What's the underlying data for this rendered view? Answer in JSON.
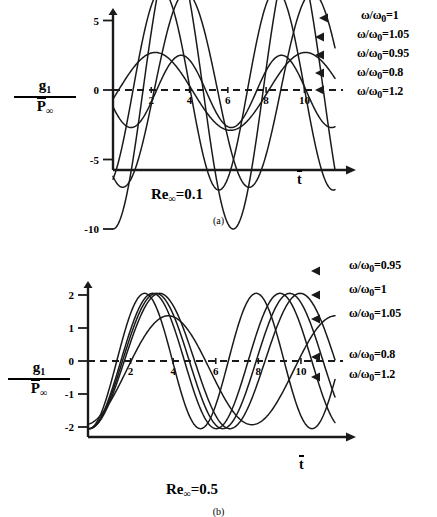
{
  "figure": {
    "ylabel_numerator": "g",
    "ylabel_numerator_sub": "1",
    "ylabel_denominator": "P",
    "ylabel_denominator_sub": "∞",
    "xlabel": "t"
  },
  "panel_a": {
    "subcaption": "(a)",
    "condition_label": "Re",
    "condition_sub": "∞",
    "condition_value": "=0.1",
    "legend": [
      {
        "label": "ω/ω",
        "sub": "0",
        "value": "=1"
      },
      {
        "label": "ω/ω",
        "sub": "0",
        "value": "=1.05"
      },
      {
        "label": "ω/ω",
        "sub": "0",
        "value": "=0.95"
      },
      {
        "label": "ω/ω",
        "sub": "0",
        "value": "=0.8"
      },
      {
        "label": "ω/ω",
        "sub": "0",
        "value": "=1.2"
      }
    ]
  },
  "panel_b": {
    "subcaption": "(b)",
    "condition_label": "Re",
    "condition_sub": "∞",
    "condition_value": "=0.5",
    "legend": [
      {
        "label": "ω/ω",
        "sub": "0",
        "value": "=0.95"
      },
      {
        "label": "ω/ω",
        "sub": "0",
        "value": "=1"
      },
      {
        "label": "ω/ω",
        "sub": "0",
        "value": "=1.05"
      },
      {
        "label": "ω/ω",
        "sub": "0",
        "value": "=0.8"
      },
      {
        "label": "ω/ω",
        "sub": "0",
        "value": "=1.2"
      }
    ]
  },
  "chart_data": [
    {
      "id": "panel_a",
      "type": "line",
      "title": "Re_inf = 0.1",
      "xlabel": "t̄",
      "ylabel": "g1/P̄_inf",
      "xlim": [
        0,
        11.6
      ],
      "ylim": [
        -10.8,
        10.8
      ],
      "xticks": [
        2,
        4,
        6,
        8,
        10
      ],
      "yticks": [
        10,
        5,
        0,
        -5,
        -10
      ],
      "grid": false,
      "zero_line": "dashed",
      "legend_position": "right",
      "series": [
        {
          "name": "ω/ω0=1",
          "amplitude": 10.0,
          "period": 6.28,
          "phase": -1.5708,
          "offset": 0.0,
          "damping": 0.0
        },
        {
          "name": "ω/ω0=1.05",
          "amplitude": 7.2,
          "period": 5.98,
          "phase": -1.1,
          "offset": 0.0,
          "damping": 0.0
        },
        {
          "name": "ω/ω0=0.95",
          "amplitude": 7.0,
          "period": 6.61,
          "phase": -2.05,
          "offset": 0.0,
          "damping": 0.0
        },
        {
          "name": "ω/ω0=0.8",
          "amplitude": 2.8,
          "period": 7.85,
          "phase": -0.2,
          "offset": -0.1,
          "damping": 0.0
        },
        {
          "name": "ω/ω0=1.2",
          "amplitude": 2.6,
          "period": 5.24,
          "phase": -2.7,
          "offset": -0.1,
          "damping": 0.0
        }
      ]
    },
    {
      "id": "panel_b",
      "type": "line",
      "title": "Re_inf = 0.5",
      "xlabel": "t̄",
      "ylabel": "g1/P̄_inf",
      "xlim": [
        0,
        11.6
      ],
      "ylim": [
        -2.35,
        2.35
      ],
      "xticks": [
        2,
        4,
        6,
        8,
        10
      ],
      "yticks": [
        2,
        1,
        0,
        -1,
        -2
      ],
      "grid": false,
      "zero_line": "dashed",
      "legend_position": "right",
      "series": [
        {
          "name": "ω/ω0=0.95",
          "amplitude": 2.05,
          "period": 6.61,
          "phase": -1.62,
          "offset": 0.0,
          "damping": 0.0
        },
        {
          "name": "ω/ω0=1",
          "amplitude": 2.05,
          "period": 6.28,
          "phase": -1.62,
          "offset": 0.0,
          "damping": 0.0
        },
        {
          "name": "ω/ω0=1.05",
          "amplitude": 2.05,
          "period": 5.98,
          "phase": -1.62,
          "offset": 0.0,
          "damping": 0.0
        },
        {
          "name": "ω/ω0=0.8",
          "amplitude": 1.65,
          "period": 7.85,
          "phase": -1.45,
          "offset": -0.28,
          "damping": 0.0
        },
        {
          "name": "ω/ω0=1.2",
          "amplitude": 2.05,
          "period": 5.24,
          "phase": -1.62,
          "offset": 0.0,
          "damping": 0.0
        }
      ]
    }
  ]
}
